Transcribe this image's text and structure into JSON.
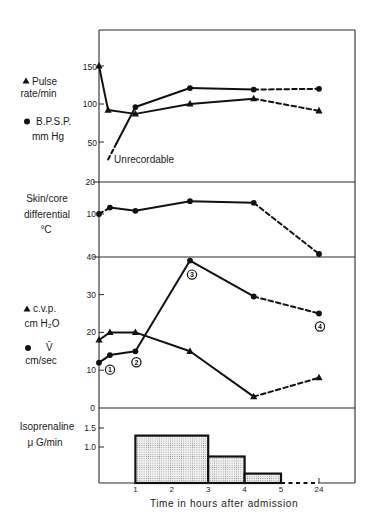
{
  "figure": {
    "panels": {
      "pulse": {
        "legend": [
          {
            "symbol": "triangle",
            "line1": "Pulse",
            "line2": "rate/min"
          },
          {
            "symbol": "circle",
            "line1": "B.P.S.P.",
            "line2": "mm Hg"
          }
        ],
        "yticks": [
          "150",
          "100",
          "50"
        ],
        "annotation": "Unrecordable"
      },
      "skin": {
        "label": [
          "Skin/core",
          "differential",
          "°C"
        ],
        "yticks": [
          "20",
          "10"
        ]
      },
      "cvp": {
        "legend": [
          {
            "symbol": "triangle",
            "line1": "c.v.p.",
            "line2": "cm H₂O"
          },
          {
            "symbol": "circle",
            "line1": "V̄",
            "line2": "cm/sec"
          }
        ],
        "yticks": [
          "40",
          "30",
          "20",
          "10",
          "0"
        ]
      },
      "isoprenaline": {
        "label": [
          "Isoprenaline",
          "μ G/min"
        ],
        "yticks": [
          "1.5",
          "1.0"
        ]
      }
    },
    "xaxis": {
      "ticks": [
        "1",
        "2",
        "3",
        "4",
        "5",
        "24"
      ],
      "label": "Time in hours after admission"
    }
  },
  "chart_data": [
    {
      "type": "line",
      "panel": "Pulse rate and B.P.S.P.",
      "xlabel": "Time in hours after admission",
      "ylabel": "Pulse rate/min ; B.P.S.P. mm Hg",
      "xticks": [
        1,
        2,
        3,
        4,
        5,
        24
      ],
      "yticks": [
        50,
        100,
        150
      ],
      "series": [
        {
          "name": "Pulse rate/min",
          "marker": "triangle",
          "x": [
            0,
            0.25,
            1,
            2.5,
            4.25,
            24
          ],
          "values": [
            150,
            92,
            87,
            100,
            107,
            91
          ],
          "segment_styles": [
            "solid",
            "solid",
            "solid",
            "solid",
            "dashed"
          ]
        },
        {
          "name": "B.P.S.P. mm Hg",
          "marker": "circle",
          "x": [
            0.25,
            1,
            2.5,
            4.25,
            24
          ],
          "values": [
            27,
            96,
            121,
            119,
            120
          ],
          "markers_from_index": 1,
          "segment_styles": [
            "mixed",
            "solid",
            "solid",
            "dashed"
          ],
          "annotation": {
            "text": "Unrecordable",
            "at_index": 0
          }
        }
      ]
    },
    {
      "type": "line",
      "panel": "Skin/core differential",
      "ylabel": "Skin/core differential °C",
      "yticks": [
        10,
        20
      ],
      "series": [
        {
          "name": "Skin/core differential °C",
          "marker": "circle",
          "x": [
            0,
            0.3,
            1,
            2.5,
            4.25,
            24
          ],
          "values": [
            10,
            12,
            11,
            14,
            13.5,
            -2.5
          ],
          "segment_styles": [
            "dashed",
            "solid",
            "solid",
            "solid",
            "dashed"
          ]
        }
      ]
    },
    {
      "type": "line",
      "panel": "c.v.p. and V̄",
      "ylabel": "c.v.p. cm H₂O ; V̄ cm/sec",
      "yticks": [
        0,
        10,
        20,
        30,
        40
      ],
      "ylim": [
        0,
        40
      ],
      "series": [
        {
          "name": "c.v.p. cm H₂O",
          "marker": "triangle",
          "x": [
            0,
            0.3,
            1,
            2.5,
            4.25,
            24
          ],
          "values": [
            18,
            20,
            20,
            15,
            3,
            8
          ],
          "segment_styles": [
            "solid",
            "solid",
            "solid",
            "solid",
            "dashed"
          ]
        },
        {
          "name": "V̄ cm/sec",
          "marker": "circle",
          "x": [
            0,
            0.3,
            1,
            2.5,
            4.25,
            24
          ],
          "values": [
            12,
            14,
            15,
            39,
            29.5,
            25
          ],
          "segment_styles": [
            "solid",
            "solid",
            "solid",
            "solid",
            "dashed"
          ],
          "point_labels": {
            "0": "1",
            "2": "2",
            "3": "3",
            "5": "4"
          }
        }
      ]
    },
    {
      "type": "bar",
      "panel": "Isoprenaline",
      "ylabel": "Isoprenaline μ G/min",
      "yticks": [
        1.0,
        1.5
      ],
      "bars": [
        {
          "x0": 1,
          "x1": 3,
          "value": 1.3
        },
        {
          "x0": 3,
          "x1": 4,
          "value": 0.75
        },
        {
          "x0": 4,
          "x1": 5,
          "value": 0.3
        }
      ],
      "zero_segment": {
        "x0": 5,
        "x1": 24,
        "style": "dashed"
      }
    }
  ]
}
